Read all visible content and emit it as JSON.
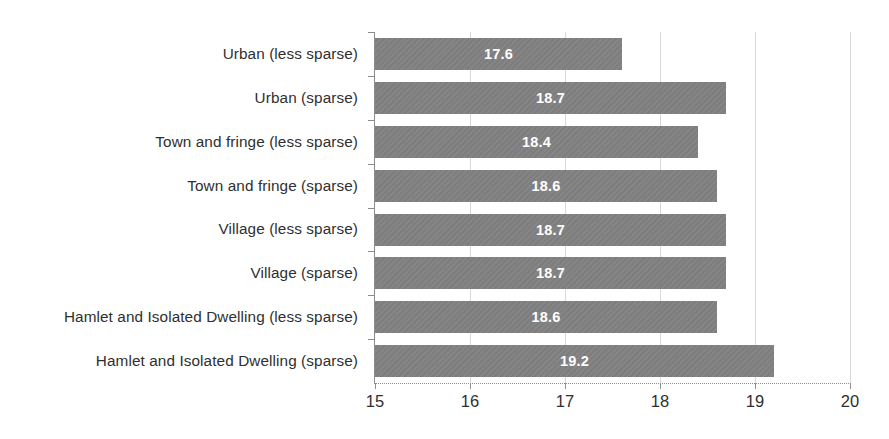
{
  "chart_data": {
    "type": "bar",
    "orientation": "horizontal",
    "title": "",
    "subtitle": "",
    "xlabel": "",
    "ylabel": "",
    "xlim": [
      15,
      20
    ],
    "xticks": [
      "15",
      "16",
      "17",
      "18",
      "19",
      "20"
    ],
    "grid": true,
    "legend": false,
    "legend_position": "none",
    "bar_color": "#808080",
    "value_label_color": "#ffffff",
    "categories": [
      "Urban (less sparse)",
      "Urban (sparse)",
      "Town and fringe (less sparse)",
      "Town and fringe (sparse)",
      "Village (less sparse)",
      "Village (sparse)",
      "Hamlet and Isolated Dwelling (less sparse)",
      "Hamlet and Isolated Dwelling (sparse)"
    ],
    "values": [
      17.6,
      18.7,
      18.4,
      18.6,
      18.7,
      18.7,
      18.6,
      19.2
    ],
    "value_labels": [
      "17.6",
      "18.7",
      "18.4",
      "18.6",
      "18.7",
      "18.7",
      "18.6",
      "19.2"
    ]
  }
}
